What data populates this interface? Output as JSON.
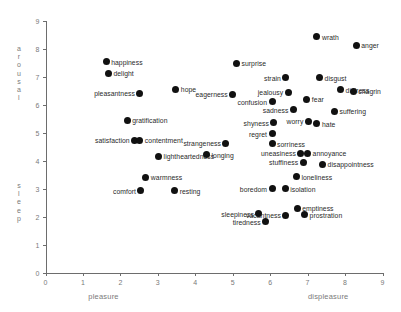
{
  "chart_data": {
    "type": "scatter",
    "title": "",
    "xlabel_left": "pleasure",
    "xlabel_right": "displeasure",
    "ylabel_top": "arousal",
    "ylabel_bottom": "sleep",
    "xlim": [
      0,
      9
    ],
    "ylim": [
      0,
      9
    ],
    "xticks": [
      "0",
      "1",
      "2",
      "3",
      "4",
      "5",
      "6",
      "7",
      "8",
      "9"
    ],
    "yticks": [
      "0",
      "1",
      "2",
      "3",
      "4",
      "5",
      "6",
      "7",
      "8",
      "9"
    ],
    "grid": false,
    "legend": "none",
    "xlabel_left_x": 1.55,
    "xlabel_right_x": 7.55,
    "point_color": "#111111",
    "axis_color": "#6d6d6d",
    "points": [
      {
        "label": "happiness",
        "x": 1.62,
        "y": 7.52,
        "side": "right"
      },
      {
        "label": "delight",
        "x": 1.68,
        "y": 7.12,
        "side": "right"
      },
      {
        "label": "pleasantness",
        "x": 2.52,
        "y": 6.4,
        "side": "left"
      },
      {
        "label": "hope",
        "x": 3.48,
        "y": 6.54,
        "side": "right"
      },
      {
        "label": "gratification",
        "x": 2.18,
        "y": 5.44,
        "side": "right"
      },
      {
        "label": "satisfaction",
        "x": 2.38,
        "y": 4.72,
        "side": "left"
      },
      {
        "label": "contentment",
        "x": 2.52,
        "y": 4.72,
        "side": "right"
      },
      {
        "label": "lightheartedness",
        "x": 3.02,
        "y": 4.16,
        "side": "right"
      },
      {
        "label": "warmness",
        "x": 2.68,
        "y": 3.4,
        "side": "right"
      },
      {
        "label": "comfort",
        "x": 2.55,
        "y": 2.92,
        "side": "left"
      },
      {
        "label": "resting",
        "x": 3.45,
        "y": 2.92,
        "side": "right"
      },
      {
        "label": "surprise",
        "x": 5.1,
        "y": 7.48,
        "side": "right"
      },
      {
        "label": "eagerness",
        "x": 5.0,
        "y": 6.36,
        "side": "left"
      },
      {
        "label": "strangeness",
        "x": 4.82,
        "y": 4.62,
        "side": "left"
      },
      {
        "label": "longing",
        "x": 4.3,
        "y": 4.2,
        "side": "right"
      },
      {
        "label": "confusion",
        "x": 6.05,
        "y": 6.1,
        "side": "left"
      },
      {
        "label": "strain",
        "x": 6.42,
        "y": 6.96,
        "side": "left"
      },
      {
        "label": "jealousy",
        "x": 6.48,
        "y": 6.44,
        "side": "left"
      },
      {
        "label": "sadness",
        "x": 6.62,
        "y": 5.82,
        "side": "left"
      },
      {
        "label": "shyness",
        "x": 6.1,
        "y": 5.34,
        "side": "left"
      },
      {
        "label": "regret",
        "x": 6.05,
        "y": 4.96,
        "side": "left"
      },
      {
        "label": "sorriness",
        "x": 6.05,
        "y": 4.6,
        "side": "right"
      },
      {
        "label": "wrath",
        "x": 7.25,
        "y": 8.42,
        "side": "right"
      },
      {
        "label": "anger",
        "x": 8.3,
        "y": 8.12,
        "side": "right"
      },
      {
        "label": "disgust",
        "x": 7.32,
        "y": 6.96,
        "side": "right"
      },
      {
        "label": "distress",
        "x": 7.88,
        "y": 6.52,
        "side": "right"
      },
      {
        "label": "chagrin",
        "x": 8.22,
        "y": 6.48,
        "side": "right"
      },
      {
        "label": "fear",
        "x": 6.98,
        "y": 6.18,
        "side": "right"
      },
      {
        "label": "worry",
        "x": 7.02,
        "y": 5.4,
        "side": "left"
      },
      {
        "label": "hate",
        "x": 7.25,
        "y": 5.32,
        "side": "right"
      },
      {
        "label": "suffering",
        "x": 7.72,
        "y": 5.76,
        "side": "right"
      },
      {
        "label": "uneasiness",
        "x": 6.82,
        "y": 4.26,
        "side": "left"
      },
      {
        "label": "annoyance",
        "x": 7.0,
        "y": 4.26,
        "side": "right"
      },
      {
        "label": "stuffiness",
        "x": 6.88,
        "y": 3.94,
        "side": "left"
      },
      {
        "label": "disappointness",
        "x": 7.4,
        "y": 3.86,
        "side": "right"
      },
      {
        "label": "loneliness",
        "x": 6.7,
        "y": 3.42,
        "side": "right"
      },
      {
        "label": "boredom",
        "x": 6.05,
        "y": 3.0,
        "side": "left"
      },
      {
        "label": "isolation",
        "x": 6.4,
        "y": 3.0,
        "side": "right"
      },
      {
        "label": "emptiness",
        "x": 6.72,
        "y": 2.3,
        "side": "right"
      },
      {
        "label": "prostration",
        "x": 6.92,
        "y": 2.06,
        "side": "right"
      },
      {
        "label": "vacantness",
        "x": 6.42,
        "y": 2.04,
        "side": "left"
      },
      {
        "label": "sleepiness",
        "x": 5.7,
        "y": 2.1,
        "side": "left"
      },
      {
        "label": "tiredness",
        "x": 5.88,
        "y": 1.82,
        "side": "left"
      }
    ]
  }
}
